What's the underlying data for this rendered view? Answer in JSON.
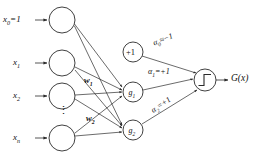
{
  "figure": {
    "type": "neural-network-diagram",
    "stroke_color": "#2b2b2b",
    "node_fill": "#ffffff",
    "text_color": "#111111"
  },
  "inputs": [
    {
      "id": "x0",
      "label_html": "x<sub>0</sub>=1",
      "cx": 62,
      "cy": 20,
      "r": 13
    },
    {
      "id": "x1",
      "label_html": "x<sub>1</sub>",
      "cx": 62,
      "cy": 63,
      "r": 13
    },
    {
      "id": "x2",
      "label_html": "x<sub>2</sub>",
      "cx": 62,
      "cy": 96,
      "r": 13
    },
    {
      "id": "xn",
      "label_html": "x<sub>n</sub>",
      "cx": 62,
      "cy": 138,
      "r": 13
    }
  ],
  "ellipsis": {
    "glyph": "⋮",
    "x": 58,
    "y": 111
  },
  "bias_node": {
    "id": "bias",
    "label": "+1",
    "cx": 133,
    "cy": 52,
    "r": 10
  },
  "hidden_nodes": [
    {
      "id": "g1",
      "label_html": "g<sub>1</sub>",
      "cx": 133,
      "cy": 92,
      "r": 10
    },
    {
      "id": "g2",
      "label_html": "g<sub>2</sub>",
      "cx": 133,
      "cy": 130,
      "r": 10
    }
  ],
  "output_node": {
    "id": "sum-step",
    "cx": 205,
    "cy": 80,
    "r": 11,
    "symbol": "step-function"
  },
  "weight_labels": [
    {
      "id": "w1",
      "label_html": "w<sub>1</sub>",
      "x": 84,
      "y": 80
    },
    {
      "id": "w2",
      "label_html": "w<sub>2</sub>",
      "x": 86,
      "y": 118
    }
  ],
  "alpha_labels": [
    {
      "id": "alpha0",
      "label_html": "α<sub>0</sub>≈−1",
      "x": 152,
      "y": 44,
      "rotation": -22
    },
    {
      "id": "alpha1",
      "label_html": "α<sub>1</sub>=+1",
      "x": 148,
      "y": 72,
      "rotation": 0
    },
    {
      "id": "alpha2",
      "label_html": "α<sub>2</sub>=+1",
      "x": 150,
      "y": 112,
      "rotation": -34
    }
  ],
  "output_label": {
    "id": "Gx",
    "label_html": "G(x)",
    "x": 232,
    "y": 75
  }
}
